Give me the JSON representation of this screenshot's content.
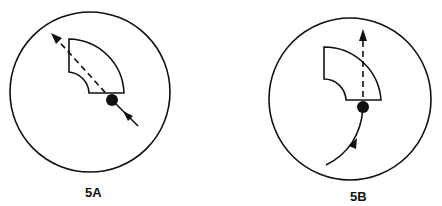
{
  "figures": [
    {
      "id": "5A",
      "label": "5A",
      "description": "Straight-through path: entry from lower right, passes through dot at sector corner, exits dashed toward upper left",
      "path_style": {
        "entry": "solid straight",
        "exit": "dashed straight diagonal"
      }
    },
    {
      "id": "5B",
      "label": "5B",
      "description": "Curved entry from lower left, passes through dot at sector corner, exits dashed straight upward",
      "path_style": {
        "entry": "solid curved",
        "exit": "dashed straight vertical"
      }
    }
  ],
  "colors": {
    "stroke": "#111111",
    "background": "#ffffff"
  }
}
